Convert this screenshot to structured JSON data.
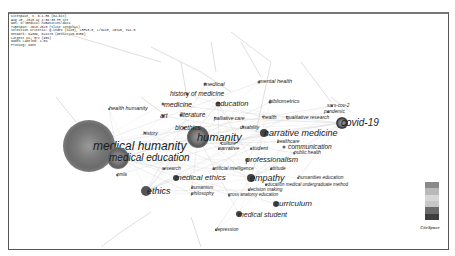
{
  "header": {
    "lines": [
      "CiteSpace, v. 6.1.R6 (64-bit)",
      "Aug 25, 2023 at 1:58:33 PM CST",
      "WoS: D:\\medical humanities\\data",
      "Timespan: 2013-2023 (Slice Length=1)",
      "Selection Criteria: g-index (k=25), LRF=3.0, L/N=10, LBY=5, e=1.0",
      "Network: N=389, E=1176 (Density=0.0156)",
      "Largest CC: 372 (95%)",
      "Nodes Labeled: 1.0%",
      "Pruning: None"
    ]
  },
  "network": {
    "nodes": [
      {
        "id": "medical-humanity",
        "label": "medical humanity",
        "x": 88,
        "y": 144,
        "r": 26,
        "fs": 12,
        "lx": 92,
        "color": "#6b6b6b"
      },
      {
        "id": "medical-education",
        "label": "medical education",
        "x": 117,
        "y": 156,
        "r": 11,
        "fs": 10,
        "lx": 108,
        "color": "#5e5e5e"
      },
      {
        "id": "humanity",
        "label": "humanity",
        "x": 197,
        "y": 135,
        "r": 11,
        "fs": 11,
        "lx": 196,
        "color": "#555"
      },
      {
        "id": "covid-19",
        "label": "covid-19",
        "x": 341,
        "y": 121,
        "r": 6,
        "fs": 10,
        "lx": 340,
        "color": "#333"
      },
      {
        "id": "narrative-medicine",
        "label": "narrative medicine",
        "x": 263,
        "y": 131,
        "r": 4,
        "fs": 9,
        "lx": 263,
        "color": "#444"
      },
      {
        "id": "empathy",
        "label": "empathy",
        "x": 250,
        "y": 176,
        "r": 4,
        "fs": 9,
        "lx": 249,
        "color": "#444"
      },
      {
        "id": "ethics",
        "label": "ethics",
        "x": 145,
        "y": 189,
        "r": 5,
        "fs": 9,
        "lx": 146,
        "color": "#555"
      },
      {
        "id": "medical-ethics",
        "label": "medical ethics",
        "x": 175,
        "y": 176,
        "r": 3,
        "fs": 8,
        "lx": 174,
        "color": "#444"
      },
      {
        "id": "curriculum",
        "label": "curriculum",
        "x": 275,
        "y": 202,
        "r": 3,
        "fs": 8,
        "lx": 274,
        "color": "#444"
      },
      {
        "id": "medical-student",
        "label": "medical student",
        "x": 238,
        "y": 212,
        "r": 3,
        "fs": 7,
        "lx": 237,
        "color": "#444"
      },
      {
        "id": "education",
        "label": "education",
        "x": 217,
        "y": 102,
        "r": 2.5,
        "fs": 7.5,
        "lx": 215,
        "color": "#555"
      },
      {
        "id": "professionalism",
        "label": "professionalism",
        "x": 246,
        "y": 158,
        "r": 2,
        "fs": 7.5,
        "lx": 245,
        "color": "#666"
      },
      {
        "id": "communication",
        "label": "communication",
        "x": 283,
        "y": 145,
        "r": 1.5,
        "fs": 6.5,
        "lx": 287,
        "color": "#666"
      },
      {
        "id": "medicine",
        "label": "medicine",
        "x": 162,
        "y": 102,
        "r": 1.5,
        "fs": 7,
        "lx": 163,
        "color": "#666"
      },
      {
        "id": "history-of-medicine",
        "label": "history of medicine",
        "x": 186,
        "y": 92,
        "r": 1.5,
        "fs": 6.5,
        "lx": 169,
        "color": "#666"
      },
      {
        "id": "medical",
        "label": "medical",
        "x": 204,
        "y": 82,
        "r": 1.5,
        "fs": 6,
        "lx": 203,
        "color": "#666"
      },
      {
        "id": "mental-health",
        "label": "mental health",
        "x": 258,
        "y": 80,
        "r": 1.5,
        "fs": 5.5,
        "lx": 258,
        "color": "#666"
      },
      {
        "id": "bibliometrics",
        "label": "bibliometrics",
        "x": 269,
        "y": 100,
        "r": 1.5,
        "fs": 5.5,
        "lx": 268,
        "color": "#666"
      },
      {
        "id": "health-humanity",
        "label": "health humanity",
        "x": 108,
        "y": 107,
        "r": 1,
        "fs": 5.5,
        "lx": 108,
        "color": "#666"
      },
      {
        "id": "art",
        "label": "art",
        "x": 162,
        "y": 114,
        "r": 1.5,
        "fs": 6.5,
        "lx": 159,
        "color": "#666"
      },
      {
        "id": "literature",
        "label": "literature",
        "x": 180,
        "y": 113,
        "r": 1.5,
        "fs": 6.5,
        "lx": 179,
        "color": "#666"
      },
      {
        "id": "palliative-care",
        "label": "palliative care",
        "x": 214,
        "y": 116,
        "r": 1.2,
        "fs": 5,
        "lx": 213,
        "color": "#666"
      },
      {
        "id": "health",
        "label": "health",
        "x": 262,
        "y": 115,
        "r": 1.2,
        "fs": 5,
        "lx": 262,
        "color": "#666"
      },
      {
        "id": "qualitative-research",
        "label": "qualitative research",
        "x": 286,
        "y": 115,
        "r": 1.2,
        "fs": 5,
        "lx": 285,
        "color": "#666"
      },
      {
        "id": "sars-cov-2",
        "label": "sars-cov-2",
        "x": 331,
        "y": 104,
        "r": 1,
        "fs": 4.8,
        "lx": 326,
        "color": "#666"
      },
      {
        "id": "pandemic",
        "label": "pandemic",
        "x": 327,
        "y": 110,
        "r": 1,
        "fs": 4.8,
        "lx": 323,
        "color": "#666"
      },
      {
        "id": "bioethics",
        "label": "bioethics",
        "x": 183,
        "y": 126,
        "r": 1.5,
        "fs": 6.5,
        "lx": 174,
        "color": "#666"
      },
      {
        "id": "disability",
        "label": "disability",
        "x": 242,
        "y": 125,
        "r": 1,
        "fs": 5,
        "lx": 239,
        "color": "#666"
      },
      {
        "id": "history",
        "label": "history",
        "x": 144,
        "y": 131,
        "r": 1,
        "fs": 5,
        "lx": 142,
        "color": "#666"
      },
      {
        "id": "culture",
        "label": "culture",
        "x": 220,
        "y": 141,
        "r": 1,
        "fs": 5,
        "lx": 220,
        "color": "#666"
      },
      {
        "id": "narrative",
        "label": "narrative",
        "x": 218,
        "y": 147,
        "r": 1,
        "fs": 5.5,
        "lx": 217,
        "color": "#666"
      },
      {
        "id": "student",
        "label": "student",
        "x": 250,
        "y": 147,
        "r": 1,
        "fs": 5.5,
        "lx": 249,
        "color": "#666"
      },
      {
        "id": "healthcare",
        "label": "healthcare",
        "x": 277,
        "y": 140,
        "r": 1,
        "fs": 4.8,
        "lx": 276,
        "color": "#666"
      },
      {
        "id": "public-health",
        "label": "public health",
        "x": 293,
        "y": 151,
        "r": 1,
        "fs": 4.8,
        "lx": 293,
        "color": "#666"
      },
      {
        "id": "research",
        "label": "research",
        "x": 163,
        "y": 167,
        "r": 1,
        "fs": 4.8,
        "lx": 161,
        "color": "#666"
      },
      {
        "id": "artificial-intelligence",
        "label": "artificial intelligence",
        "x": 213,
        "y": 167,
        "r": 1,
        "fs": 4.8,
        "lx": 211,
        "color": "#666"
      },
      {
        "id": "attitude",
        "label": "attitude",
        "x": 270,
        "y": 167,
        "r": 1,
        "fs": 4.8,
        "lx": 269,
        "color": "#666"
      },
      {
        "id": "humanities-education",
        "label": "humanities education",
        "x": 297,
        "y": 176,
        "r": 1,
        "fs": 4.8,
        "lx": 297,
        "color": "#666"
      },
      {
        "id": "education-medical-undergraduate",
        "label": "education medical undergraduate method",
        "x": 265,
        "y": 183,
        "r": 1,
        "fs": 4.5,
        "lx": 264,
        "color": "#666"
      },
      {
        "id": "decision-making",
        "label": "decision making",
        "x": 248,
        "y": 188,
        "r": 1,
        "fs": 4.8,
        "lx": 247,
        "color": "#666"
      },
      {
        "id": "gross-anatomy-education",
        "label": "gross anatomy education",
        "x": 228,
        "y": 193,
        "r": 1,
        "fs": 4.5,
        "lx": 227,
        "color": "#666"
      },
      {
        "id": "humanism",
        "label": "humanism",
        "x": 191,
        "y": 186,
        "r": 1,
        "fs": 4.8,
        "lx": 190,
        "color": "#666"
      },
      {
        "id": "philosophy",
        "label": "philosophy",
        "x": 191,
        "y": 192,
        "r": 1,
        "fs": 4.8,
        "lx": 190,
        "color": "#666"
      },
      {
        "id": "pmla",
        "label": "pmla",
        "x": 116,
        "y": 173,
        "r": 1,
        "fs": 4.5,
        "lx": 116,
        "color": "#666"
      },
      {
        "id": "depression",
        "label": "depression",
        "x": 215,
        "y": 228,
        "r": 1,
        "fs": 4.8,
        "lx": 214,
        "color": "#666"
      }
    ]
  },
  "legend": {
    "colors": [
      "#8a8a8a",
      "#b9b9b9",
      "#d6d6d6",
      "#c7c7c7",
      "#6a6a6a",
      "#3e3e3e"
    ]
  },
  "logo": {
    "title": "CiteSpace",
    "subtitle": "~ ~ ~"
  }
}
